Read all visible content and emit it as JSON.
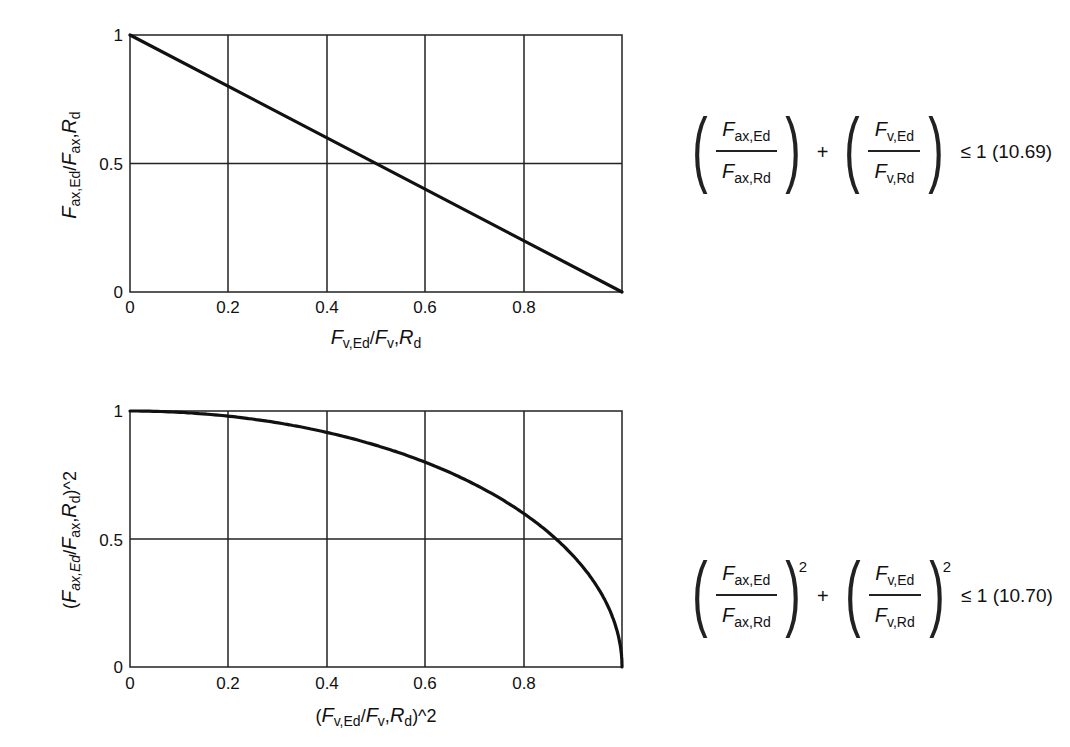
{
  "chart_data": [
    {
      "type": "line",
      "title": "",
      "xlabel": "F_v,Ed/F_v,R_d",
      "ylabel": "F_ax,Ed/F_ax,R_d",
      "xlim": [
        0,
        1
      ],
      "ylim": [
        0,
        1
      ],
      "xticks": [
        "0",
        "0.2",
        "0.4",
        "0.6",
        "0.8"
      ],
      "yticks": [
        "0",
        "0.5",
        "1"
      ],
      "grid": true,
      "series": [
        {
          "name": "Linear interaction (10.69)",
          "x": [
            0,
            0.2,
            0.4,
            0.5,
            0.6,
            0.8,
            1.0
          ],
          "y": [
            1.0,
            0.8,
            0.6,
            0.5,
            0.4,
            0.2,
            0.0
          ]
        }
      ],
      "annotation": "(F_ax,Ed / F_ax,Rd) + (F_v,Ed / F_v,Rd) ≤ 1 (10.69)"
    },
    {
      "type": "line",
      "title": "",
      "xlabel": "(F_v,Ed/F_v,R_d)^2",
      "ylabel": "(F_ax,Ed/F_ax,R_d)^2",
      "xlim": [
        0,
        1
      ],
      "ylim": [
        0,
        1
      ],
      "xticks": [
        "0",
        "0.2",
        "0.4",
        "0.6",
        "0.8"
      ],
      "yticks": [
        "0",
        "0.5",
        "1"
      ],
      "grid": true,
      "series": [
        {
          "name": "Quadratic interaction (10.70)",
          "x": [
            0,
            0.1,
            0.2,
            0.3,
            0.4,
            0.5,
            0.6,
            0.7,
            0.8,
            0.866,
            0.9,
            0.95,
            0.98,
            1.0
          ],
          "y": [
            1.0,
            0.995,
            0.98,
            0.954,
            0.917,
            0.866,
            0.8,
            0.714,
            0.6,
            0.5,
            0.436,
            0.312,
            0.199,
            0.0
          ]
        }
      ],
      "annotation": "(F_ax,Ed / F_ax,Rd)^2 + (F_v,Ed / F_v,Rd)^2 ≤ 1 (10.70)"
    }
  ],
  "plots": {
    "top": {
      "yticks": [
        "1",
        "0.5",
        "0"
      ],
      "xticks": [
        "0",
        "0.2",
        "0.4",
        "0.6",
        "0.8"
      ],
      "ylabel": {
        "F": "F",
        "sub1": "ax,Ed",
        "slash": "/",
        "F2": "F",
        "sub2": "ax",
        "comma": ",",
        "R": "R",
        "sub3": "d"
      },
      "xlabel": {
        "F": "F",
        "sub1": "v,Ed",
        "slash": "/",
        "F2": "F",
        "sub2": "v",
        "comma": ",",
        "R": "R",
        "sub3": "d"
      }
    },
    "bottom": {
      "yticks": [
        "1",
        "0.5",
        "0"
      ],
      "xticks": [
        "0",
        "0.2",
        "0.4",
        "0.6",
        "0.8"
      ],
      "ylabel": {
        "open": "(",
        "F": "F",
        "sub1": "ax,Ed",
        "slash": "/",
        "F2": "F",
        "sub2": "ax",
        "comma": ",",
        "R": "R",
        "sub3": "d",
        "close": ")^2"
      },
      "xlabel": {
        "open": "(",
        "F": "F",
        "sub1": "v,Ed",
        "slash": "/",
        "F2": "F",
        "sub2": "v",
        "comma": ",",
        "R": "R",
        "sub3": "d",
        "close": ")^2"
      }
    }
  },
  "equations": {
    "eq1": {
      "term1": {
        "num_F": "F",
        "num_sub": "ax,Ed",
        "den_F": "F",
        "den_sub": "ax,Rd"
      },
      "plus": "+",
      "term2": {
        "num_F": "F",
        "num_sub": "v,Ed",
        "den_F": "F",
        "den_sub": "v,Rd"
      },
      "rhs": "≤ 1 (10.69)"
    },
    "eq2": {
      "term1": {
        "num_F": "F",
        "num_sub": "ax,Ed",
        "den_F": "F",
        "den_sub": "ax,Rd",
        "exp": "2"
      },
      "plus": "+",
      "term2": {
        "num_F": "F",
        "num_sub": "v,Ed",
        "den_F": "F",
        "den_sub": "v,Rd",
        "exp": "2"
      },
      "rhs": "≤ 1 (10.70)"
    }
  },
  "colors": {
    "line": "#111111",
    "grid": "#222222",
    "background": "#ffffff"
  }
}
